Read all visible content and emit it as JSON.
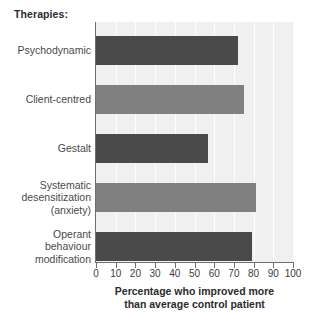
{
  "group_title": "Therapies:",
  "chart_data": {
    "type": "bar",
    "orientation": "horizontal",
    "title": "Therapies:",
    "xlabel": "Percentage who improved more\nthan average control patient",
    "ylabel": "",
    "xlim": [
      0,
      100
    ],
    "xticks": [
      0,
      10,
      20,
      30,
      40,
      50,
      60,
      70,
      80,
      90,
      100
    ],
    "xtick_labels": [
      "0",
      "10",
      "20",
      "30",
      "40",
      "50",
      "60",
      "70",
      "80",
      "90",
      "100"
    ],
    "grid": true,
    "legend": "none",
    "categories": [
      "Psychodynamic",
      "Client-centred",
      "Gestalt",
      "Systematic\ndesensitization\n(anxiety)",
      "Operant\nbehaviour\nmodification"
    ],
    "values": [
      72,
      75,
      57,
      81,
      79
    ],
    "bar_colors": [
      "#4a4a4a",
      "#808080",
      "#4a4a4a",
      "#808080",
      "#4a4a4a"
    ],
    "plot_background": "#f0f0f0",
    "gridline_color": "#fdfdfd",
    "axis_color": "#6f6f6f"
  },
  "bars": [
    {
      "label": "Psychodynamic",
      "value": 72,
      "color": "#4a4a4a",
      "top": 36,
      "height": 29
    },
    {
      "label": "Client-centred",
      "value": 75,
      "color": "#808080",
      "top": 85,
      "height": 29
    },
    {
      "label": "Gestalt",
      "value": 57,
      "color": "#4a4a4a",
      "top": 134,
      "height": 29
    },
    {
      "label": "Systematic\ndesensitization\n(anxiety)",
      "value": 81,
      "color": "#808080",
      "top": 183,
      "height": 29
    },
    {
      "label": "Operant\nbehaviour\nmodification",
      "value": 79,
      "color": "#4a4a4a",
      "top": 232,
      "height": 29
    }
  ],
  "x_axis_caption": "Percentage who improved more\nthan average control patient"
}
